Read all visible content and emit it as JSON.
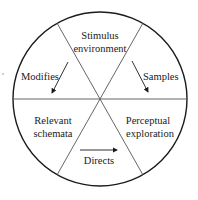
{
  "diagram": {
    "type": "perceptual-cycle-wheel",
    "sectors": {
      "top": [
        "Stimulus",
        "environment"
      ],
      "bottom_left": [
        "Relevant",
        "schemata"
      ],
      "bottom_right": [
        "Perceptual",
        "exploration"
      ]
    },
    "arrows": {
      "left": "Modifies",
      "right": "Samples",
      "bottom": "Directs"
    },
    "colors": {
      "stroke": "#1a1a1a",
      "divider": "#555555",
      "background": "#ffffff"
    }
  }
}
